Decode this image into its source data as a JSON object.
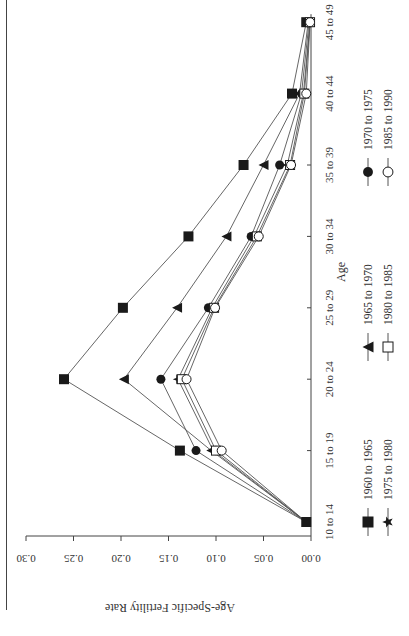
{
  "chart_data": {
    "type": "line",
    "orientation": "rotated-90-ccw",
    "title": "",
    "xlabel": "Age",
    "ylabel": "Age-Specific Fertility Rate",
    "categories": [
      "10 to 14",
      "15 to 19",
      "20 to 24",
      "25 to 29",
      "30 to 34",
      "35 to 39",
      "40 to 44",
      "45 to 49"
    ],
    "yticks": [
      "0.00",
      "0.05",
      "0.10",
      "0.15",
      "0.20",
      "0.25",
      "0.30"
    ],
    "ylim": [
      0,
      0.3
    ],
    "grid": false,
    "legend_position": "below",
    "series": [
      {
        "name": "1960 to 1965",
        "marker": "filled-square",
        "values": [
          0.005,
          0.138,
          0.26,
          0.198,
          0.129,
          0.071,
          0.02,
          0.005
        ]
      },
      {
        "name": "1965 to 1970",
        "marker": "filled-triangle",
        "values": [
          0.005,
          0.105,
          0.197,
          0.141,
          0.089,
          0.05,
          0.012,
          0.003
        ]
      },
      {
        "name": "1970 to 1975",
        "marker": "filled-circle",
        "values": [
          0.005,
          0.121,
          0.158,
          0.108,
          0.063,
          0.033,
          0.01,
          0.002
        ]
      },
      {
        "name": "1975 to 1980",
        "marker": "filled-star",
        "values": [
          0.005,
          0.103,
          0.14,
          0.104,
          0.06,
          0.025,
          0.008,
          0.001
        ]
      },
      {
        "name": "1980 to 1985",
        "marker": "open-square",
        "values": [
          0.005,
          0.1,
          0.136,
          0.102,
          0.057,
          0.022,
          0.007,
          0.001
        ]
      },
      {
        "name": "1985 to 1990",
        "marker": "open-circle",
        "values": [
          0.005,
          0.094,
          0.131,
          0.101,
          0.055,
          0.021,
          0.005,
          0.001
        ]
      }
    ]
  },
  "axes": {
    "x_label": "Age",
    "y_label": "Age-Specific Fertility Rate"
  },
  "colors": {
    "line": "#555555",
    "marker": "#1a1a1a",
    "axis": "#444444",
    "text": "#333333",
    "background": "#ffffff"
  }
}
